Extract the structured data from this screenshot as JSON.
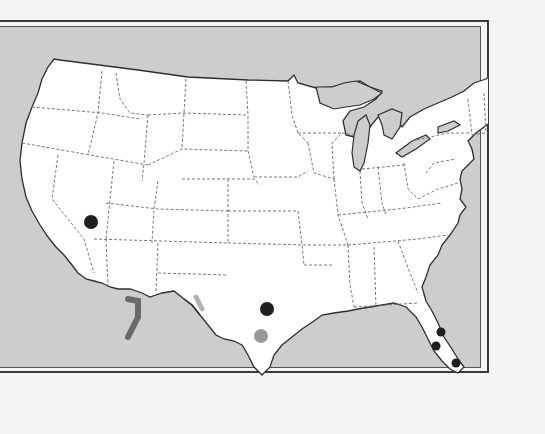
{
  "map": {
    "title": "Continental United States",
    "colors": {
      "ocean": "#cdcdcb",
      "land": "#ffffff",
      "coast": "#2e2e2e",
      "state_border": "#6a6a6a",
      "marker_dark": "#1f1f1f",
      "marker_light": "#9a9a9a",
      "range_dark": "#6a6a6a",
      "range_light": "#b4b4b4"
    },
    "markers": [
      {
        "id": "nevada",
        "label": "Southern Nevada",
        "x": 93,
        "y": 219,
        "r": 7,
        "tone": "dark"
      },
      {
        "id": "central-texas",
        "label": "Central Texas",
        "x": 269,
        "y": 306,
        "r": 7,
        "tone": "dark"
      },
      {
        "id": "south-texas",
        "label": "South Texas",
        "x": 263,
        "y": 333,
        "r": 7,
        "tone": "light"
      },
      {
        "id": "florida-east",
        "label": "East Florida",
        "x": 443,
        "y": 329,
        "r": 4,
        "tone": "dark"
      },
      {
        "id": "florida-west",
        "label": "West Florida",
        "x": 438,
        "y": 343,
        "r": 4,
        "tone": "dark"
      },
      {
        "id": "florida-south",
        "label": "South Florida",
        "x": 458,
        "y": 360,
        "r": 4,
        "tone": "dark"
      }
    ],
    "ranges": [
      {
        "id": "baja-range",
        "label": "Baja California range",
        "tone": "dark"
      },
      {
        "id": "new-mexico-range",
        "label": "Southern New Mexico range",
        "tone": "light"
      }
    ]
  }
}
